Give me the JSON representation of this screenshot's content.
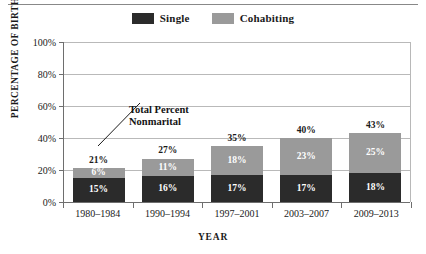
{
  "colors": {
    "single": "#2b2b2b",
    "cohabiting": "#9a9a9a",
    "text": "#1a1a1a",
    "axis": "#6e6e6e",
    "grid": "#b9b9b9"
  },
  "legend": {
    "entries": [
      {
        "label": "Single",
        "swatch_name": "legend-swatch-single",
        "color": "#2b2b2b"
      },
      {
        "label": "Cohabiting",
        "swatch_name": "legend-swatch-cohabiting",
        "color": "#9a9a9a"
      }
    ]
  },
  "annotation": {
    "line1": "Total Percent",
    "line2": "Nonmarital"
  },
  "chart_data": {
    "type": "bar",
    "subtype": "stacked-vertical",
    "title": "",
    "xlabel": "YEAR",
    "ylabel": "PERCENTAGE OF BIRTHS",
    "categories": [
      "1980–1984",
      "1990–1994",
      "1997–2001",
      "2003–2007",
      "2009–2013"
    ],
    "series": [
      {
        "name": "Single",
        "color": "#2b2b2b",
        "values": [
          15,
          16,
          17,
          17,
          18
        ],
        "value_labels": [
          "15%",
          "16%",
          "17%",
          "17%",
          "18%"
        ]
      },
      {
        "name": "Cohabiting",
        "color": "#9a9a9a",
        "values": [
          6,
          11,
          18,
          23,
          25
        ],
        "value_labels": [
          "6%",
          "11%",
          "18%",
          "23%",
          "25%"
        ]
      }
    ],
    "totals": [
      21,
      27,
      35,
      40,
      43
    ],
    "total_labels": [
      "21%",
      "27%",
      "35%",
      "40%",
      "43%"
    ],
    "ylim": [
      0,
      100
    ],
    "yticks": [
      0,
      20,
      40,
      60,
      80,
      100
    ],
    "ytick_labels": [
      "0%",
      "20%",
      "40%",
      "60%",
      "80%",
      "100%"
    ],
    "grid": true,
    "legend_position": "top-center",
    "annotations": [
      {
        "text": "Total Percent Nonmarital",
        "points_to": "total label of 1980–1984 bar"
      }
    ]
  }
}
